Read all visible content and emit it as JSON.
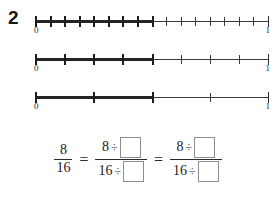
{
  "question": {
    "number": "2"
  },
  "numberlines": [
    {
      "id": "numberline-sixteenths",
      "divisions": 16,
      "shaded_to": 8,
      "left_label": "0",
      "right_label": "1"
    },
    {
      "id": "numberline-eighths",
      "divisions": 8,
      "shaded_to": 4,
      "left_label": "0",
      "right_label": "1"
    },
    {
      "id": "numberline-fourths",
      "divisions": 4,
      "shaded_to": 2,
      "left_label": "0",
      "right_label": "1"
    }
  ],
  "equation": {
    "fraction_1": {
      "numerator": "8",
      "denominator": "16"
    },
    "equals_1": "=",
    "fraction_2": {
      "numerator_value": "8",
      "numerator_operator": "÷",
      "numerator_blank": "",
      "denominator_value": "16",
      "denominator_operator": "÷",
      "denominator_blank": ""
    },
    "equals_2": "=",
    "fraction_3": {
      "numerator_value": "8",
      "numerator_operator": "÷",
      "numerator_blank": "",
      "denominator_value": "16",
      "denominator_operator": "÷",
      "denominator_blank": ""
    }
  },
  "colors": {
    "ink": "#2b2b2b",
    "shade": "#232323",
    "blank_border": "#8e8e8e",
    "paper": "#ffffff"
  }
}
